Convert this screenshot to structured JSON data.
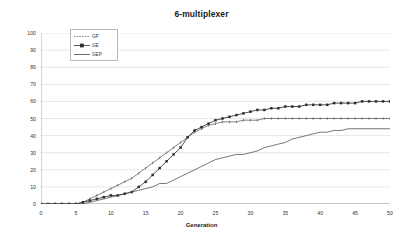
{
  "chart": {
    "title": "6-multiplexer",
    "xlabel": "Generation",
    "ylabel": "Success Rate %"
  },
  "legend": {
    "position": "top-left-inside",
    "items": [
      {
        "label": "GP",
        "marker": "tick-dash",
        "color": "#555555"
      },
      {
        "label": "GE",
        "marker": "square",
        "color": "#333333"
      },
      {
        "label": "GEP",
        "marker": "line",
        "color": "#444444"
      }
    ]
  },
  "chart_data": {
    "type": "line",
    "title": "6-multiplexer",
    "xlabel": "Generation",
    "ylabel": "Success Rate %",
    "xlim": [
      0,
      50
    ],
    "ylim": [
      0,
      100
    ],
    "xticks": [
      0,
      5,
      10,
      15,
      20,
      25,
      30,
      35,
      40,
      45,
      50
    ],
    "yticks": [
      0,
      10,
      20,
      30,
      40,
      50,
      60,
      70,
      80,
      90,
      100
    ],
    "grid": "horizontal",
    "x": [
      0,
      1,
      2,
      3,
      4,
      5,
      6,
      7,
      8,
      9,
      10,
      11,
      12,
      13,
      14,
      15,
      16,
      17,
      18,
      19,
      20,
      21,
      22,
      23,
      24,
      25,
      26,
      27,
      28,
      29,
      30,
      31,
      32,
      33,
      34,
      35,
      36,
      37,
      38,
      39,
      40,
      41,
      42,
      43,
      44,
      45,
      46,
      47,
      48,
      49,
      50
    ],
    "series": [
      {
        "name": "GP",
        "color": "#5a5a5a",
        "marker": "tick",
        "values": [
          0,
          0,
          0,
          0,
          0,
          0,
          1,
          3,
          5,
          7,
          9,
          11,
          13,
          15,
          18,
          21,
          24,
          27,
          30,
          33,
          36,
          39,
          42,
          44,
          46,
          47,
          48,
          48,
          48,
          49,
          49,
          49,
          50,
          50,
          50,
          50,
          50,
          50,
          50,
          50,
          50,
          50,
          50,
          50,
          50,
          50,
          50,
          50,
          50,
          50,
          50
        ]
      },
      {
        "name": "GE",
        "color": "#2f2f2f",
        "marker": "square",
        "values": [
          0,
          0,
          0,
          0,
          0,
          0,
          1,
          2,
          3,
          4,
          5,
          5,
          6,
          7,
          10,
          13,
          17,
          21,
          25,
          29,
          33,
          39,
          43,
          45,
          47,
          49,
          50,
          51,
          52,
          53,
          54,
          55,
          55,
          56,
          56,
          57,
          57,
          57,
          58,
          58,
          58,
          58,
          59,
          59,
          59,
          59,
          60,
          60,
          60,
          60,
          60
        ]
      },
      {
        "name": "GEP",
        "color": "#4a4a4a",
        "marker": "none",
        "values": [
          0,
          0,
          0,
          0,
          0,
          0,
          0,
          1,
          2,
          3,
          4,
          5,
          6,
          7,
          8,
          9,
          10,
          12,
          12,
          14,
          16,
          18,
          20,
          22,
          24,
          26,
          27,
          28,
          29,
          29,
          30,
          31,
          33,
          34,
          35,
          36,
          38,
          39,
          40,
          41,
          42,
          42,
          43,
          43,
          44,
          44,
          44,
          44,
          44,
          44,
          44
        ]
      }
    ]
  }
}
